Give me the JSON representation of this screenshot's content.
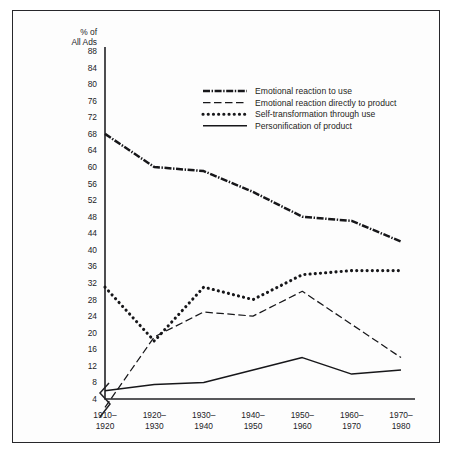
{
  "figure": {
    "axis_header_line1": "% of",
    "axis_header_line2": "All Ads",
    "axis_break_icon": "axis-break-zigzag"
  },
  "chart_data": {
    "type": "line",
    "title": "",
    "xlabel": "",
    "ylabel": "% of All Ads",
    "categories": [
      "1910–1920",
      "1920–1930",
      "1930–1940",
      "1940–1950",
      "1950–1960",
      "1960–1970",
      "1970–1980"
    ],
    "category_lines": [
      [
        "1910–",
        "1920"
      ],
      [
        "1920–",
        "1930"
      ],
      [
        "1930–",
        "1940"
      ],
      [
        "1940–",
        "1950"
      ],
      [
        "1950–",
        "1960"
      ],
      [
        "1960–",
        "1970"
      ],
      [
        "1970–",
        "1980"
      ]
    ],
    "ylim": [
      4,
      88
    ],
    "ytick_step": 4,
    "yticks": [
      88,
      84,
      80,
      76,
      72,
      68,
      64,
      60,
      56,
      52,
      48,
      44,
      40,
      36,
      32,
      28,
      24,
      20,
      16,
      12,
      8,
      4
    ],
    "grid": false,
    "legend_position": "top-center",
    "axis_break": true,
    "series": [
      {
        "name": "Emotional reaction to use",
        "style": "dash-dot",
        "color": "#17171a",
        "values": [
          68,
          60,
          59,
          54,
          48,
          47,
          42
        ]
      },
      {
        "name": "Emotional reaction directly to product",
        "style": "dashed",
        "color": "#17171a",
        "values": [
          2,
          19,
          25,
          24,
          30,
          22,
          14
        ]
      },
      {
        "name": "Self-transformation through use",
        "style": "dotted",
        "color": "#17171a",
        "values": [
          31,
          18,
          31,
          28,
          34,
          35,
          35
        ]
      },
      {
        "name": "Personification of product",
        "style": "solid",
        "color": "#17171a",
        "values": [
          6,
          7.5,
          8,
          11,
          14,
          10,
          11
        ]
      }
    ]
  }
}
